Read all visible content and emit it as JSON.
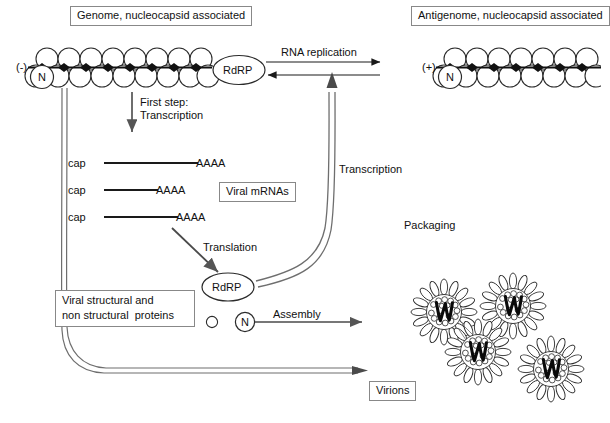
{
  "diagram": {
    "title_hidden": "",
    "boxes": {
      "genome": "Genome, nucleocapsid associated",
      "antigenome": "Antigenome, nucleocapsid associated",
      "viral_mrnas": "Viral mRNAs",
      "proteins_line1": "Viral structural and",
      "proteins_line2": "non structural  proteins",
      "virions": "Virions"
    },
    "labels": {
      "genome_polarity": "(-)",
      "antigenome_polarity": "(+)",
      "n_protein_genome": "N",
      "n_protein_antigenome": "N",
      "n_protein_free": "N",
      "rdrp_genome": "RdRP",
      "rdrp_free": "RdRP",
      "rna_replication": "RNA replication",
      "first_step_line1": "First step:",
      "first_step_line2": "Transcription",
      "transcription": "Transcription",
      "translation": "Translation",
      "packaging": "Packaging",
      "assembly": "Assembly"
    },
    "mrnas": [
      {
        "cap": "cap",
        "tail": "AAAA",
        "length": 98
      },
      {
        "cap": "cap",
        "tail": "AAAA",
        "length": 58
      },
      {
        "cap": "cap",
        "tail": "AAAA",
        "length": 78
      }
    ],
    "nucleocapsid": {
      "genome_top_subunits": 8,
      "genome_bottom_subunits": 8,
      "antigenome_top_subunits": 8,
      "antigenome_bottom_subunits": 8
    },
    "virion_count": 4,
    "colors": {
      "stroke": "#2b2b2b",
      "box_border": "#8a8a8a",
      "background": "#ffffff",
      "rna_dark": "#111111",
      "arrow_gray": "#6b6b6b"
    }
  }
}
